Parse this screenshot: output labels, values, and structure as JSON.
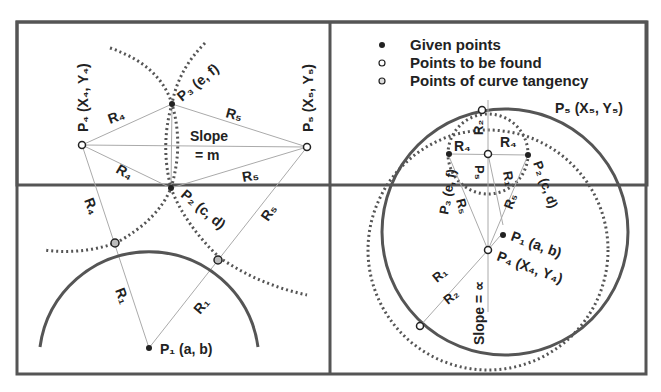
{
  "legend": {
    "items": [
      {
        "marker": "filled-dot",
        "label": "Given points"
      },
      {
        "marker": "open-dot",
        "label": "Points to be found"
      },
      {
        "marker": "gray-dot",
        "label": "Points of curve tangency"
      }
    ]
  },
  "left_diagram": {
    "p4": "P₄ (X₄, Y₄)",
    "p5": "P₅ (X₅, Y₅)",
    "p3": "P₃ (e, f)",
    "p2": "P₂ (c, d)",
    "p1": "P₁ (a, b)",
    "slope_line1": "Slope",
    "slope_line2": "= m",
    "r4_a": "R₄",
    "r4_b": "R₄",
    "r4_c": "R₄",
    "r5_a": "R₅",
    "r5_b": "R₅",
    "r5_c": "R₅",
    "r1_a": "R₁",
    "r1_b": "R₁"
  },
  "right_diagram": {
    "p5": "P₅ (X₅, Y₅)",
    "p5_center": "P₅",
    "p3": "P₃ (e, f)",
    "p2": "P₂ (c, d)",
    "p1": "P₁ (a, b)",
    "p4": "P₄ (X₄, Y₄)",
    "r2_top": "R₂",
    "r4_left": "R₄",
    "r4_right": "R₄",
    "r1_mid": "R₁",
    "r5_left": "R₅",
    "r5_right": "R₅",
    "r1_low": "R₁",
    "r2_low": "R₂",
    "slope": "Slope = ∝"
  },
  "colors": {
    "frame": "#555555",
    "curve": "#555555",
    "dotted": "#555555",
    "thin_line": "#aaaaaa",
    "text": "#222222",
    "tangency_fill": "#bbbbbb"
  }
}
